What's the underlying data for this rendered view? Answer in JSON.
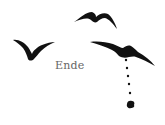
{
  "text": {
    "label": "Ende"
  },
  "colors": {
    "ink": "#111111",
    "text": "#666666",
    "background": "#ffffff"
  },
  "figures": [
    "bird-top",
    "bird-left",
    "bird-right",
    "dropping-trail",
    "splat"
  ]
}
